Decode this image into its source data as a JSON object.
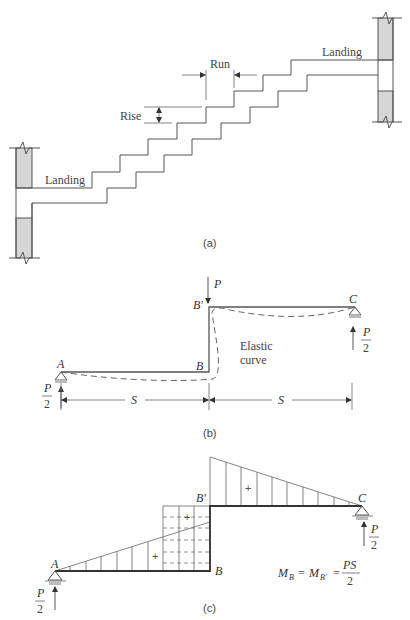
{
  "figure_a": {
    "caption": "(a)",
    "labels": {
      "landing_upper": "Landing",
      "landing_lower": "Landing",
      "run": "Run",
      "rise": "Rise"
    }
  },
  "figure_b": {
    "caption": "(b)",
    "labels": {
      "load": "P",
      "point_a": "A",
      "point_b": "B",
      "point_b_prime": "B′",
      "point_c": "C",
      "elastic_curve_line1": "Elastic",
      "elastic_curve_line2": "curve",
      "span_left": "S",
      "span_right": "S",
      "reaction_a_num": "P",
      "reaction_a_den": "2",
      "reaction_c_num": "P",
      "reaction_c_den": "2"
    }
  },
  "figure_c": {
    "caption": "(c)",
    "labels": {
      "point_a": "A",
      "point_b": "B",
      "point_b_prime": "B′",
      "point_c": "C",
      "sign_right": "+",
      "sign_box": "+",
      "sign_left": "+",
      "reaction_a_num": "P",
      "reaction_a_den": "2",
      "reaction_c_num": "P",
      "reaction_c_den": "2"
    },
    "equation": {
      "m": "M",
      "sub_b": "B",
      "eq1": "=",
      "m2": "M",
      "sub_b_prime": "B′",
      "eq2": "=",
      "num": "PS",
      "den": "2"
    }
  }
}
